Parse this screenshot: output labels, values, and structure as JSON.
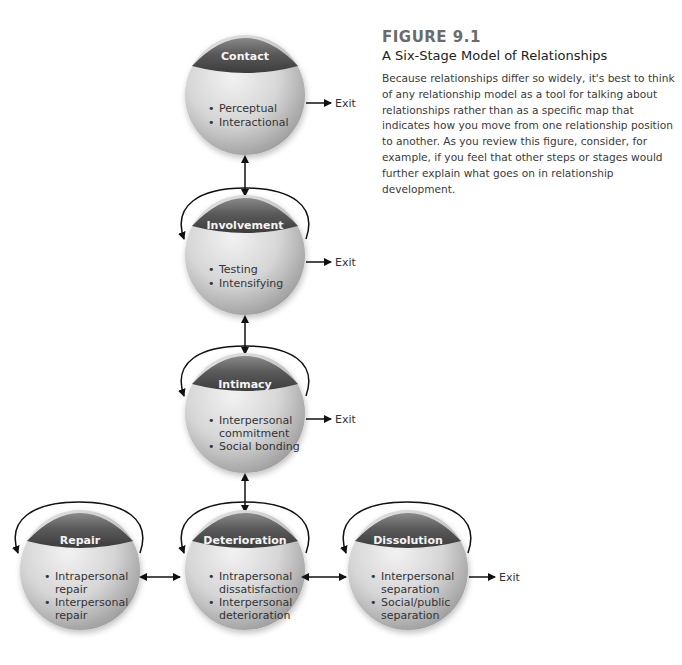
{
  "figure": {
    "number": "FIGURE 9.1",
    "title": "A Six-Stage Model of Relationships",
    "caption": "Because relationships differ so widely, it's best to think of any relationship model as a tool for talking about relationships rather than as a specific map that indicates how you move from one relationship position to another. As you review this figure, consider, for example, if you feel that other steps or stages would further explain what goes on in relationship development."
  },
  "colors": {
    "sphere_light": "#e8e8e8",
    "sphere_dark": "#9a9a9a",
    "cap_dark": "#4a4a4a",
    "arrow": "#111111"
  },
  "exit_label": "Exit",
  "stages": [
    {
      "id": "contact",
      "title": "Contact",
      "items": [
        "Perceptual",
        "Interactional"
      ],
      "lines": [
        [
          "•",
          "Perceptual"
        ],
        [
          "•",
          "Interactional"
        ]
      ]
    },
    {
      "id": "involvement",
      "title": "Involvement",
      "items": [
        "Testing",
        "Intensifying"
      ]
    },
    {
      "id": "intimacy",
      "title": "Intimacy",
      "items": [
        "Interpersonal commitment",
        "Social bonding"
      ]
    },
    {
      "id": "repair",
      "title": "Repair",
      "items": [
        "Intrapersonal repair",
        "Interpersonal repair"
      ]
    },
    {
      "id": "deterioration",
      "title": "Deterioration",
      "items": [
        "Intrapersonal dissatisfaction",
        "Interpersonal deterioration"
      ]
    },
    {
      "id": "dissolution",
      "title": "Dissolution",
      "items": [
        "Interpersonal separation",
        "Social/public separation"
      ]
    }
  ],
  "text_lines": {
    "contact": [
      "Perceptual",
      "Interactional"
    ],
    "involvement": [
      "Testing",
      "Intensifying"
    ],
    "intimacy": [
      "Interpersonal",
      "commitment",
      "Social bonding"
    ],
    "repair": [
      "Intrapersonal",
      "repair",
      "Interpersonal",
      "repair"
    ],
    "deterioration": [
      "Intrapersonal",
      "dissatisfaction",
      "Interpersonal",
      "deterioration"
    ],
    "dissolution": [
      "Interpersonal",
      "separation",
      "Social/public",
      "separation"
    ]
  },
  "bullet": "•"
}
